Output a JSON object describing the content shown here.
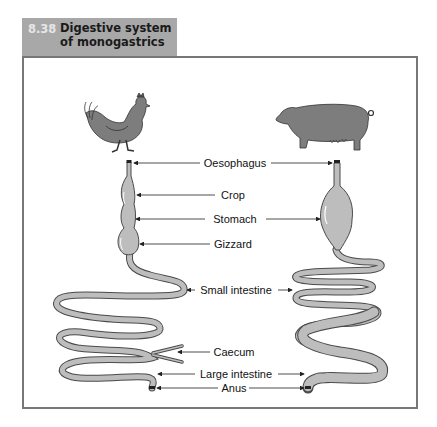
{
  "figure": {
    "number": "8.38",
    "title_line1": "Digestive system",
    "title_line2": "of monogastrics"
  },
  "animals": {
    "left": "chicken",
    "right": "pig"
  },
  "labels": {
    "oesophagus": "Oesophagus",
    "crop": "Crop",
    "stomach": "Stomach",
    "gizzard": "Gizzard",
    "small_intestine": "Small intestine",
    "caecum": "Caecum",
    "large_intestine": "Large intestine",
    "anus": "Anus"
  },
  "colors": {
    "title_bg": "#a8a8a8",
    "organ_fill": "#b9b9b9",
    "outline": "#4a4a4a",
    "animal_fill": "#7d7d7d"
  }
}
